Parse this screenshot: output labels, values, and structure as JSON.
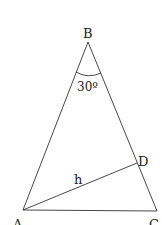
{
  "diagram": {
    "type": "geometry-triangle",
    "vertices": {
      "A": {
        "label": "A",
        "x": 23,
        "y": 210
      },
      "B": {
        "label": "B",
        "x": 88,
        "y": 42
      },
      "C": {
        "label": "C",
        "x": 157,
        "y": 211
      },
      "D": {
        "label": "D",
        "x": 137,
        "y": 163
      }
    },
    "segments": [
      {
        "from": "A",
        "to": "B"
      },
      {
        "from": "B",
        "to": "C"
      },
      {
        "from": "A",
        "to": "C"
      },
      {
        "from": "A",
        "to": "D",
        "label": "h"
      }
    ],
    "angle_at_B": "30º",
    "segment_AD_label": "h",
    "colors": {
      "stroke": "#333333",
      "text": "#222222",
      "background": "#ffffff"
    }
  }
}
